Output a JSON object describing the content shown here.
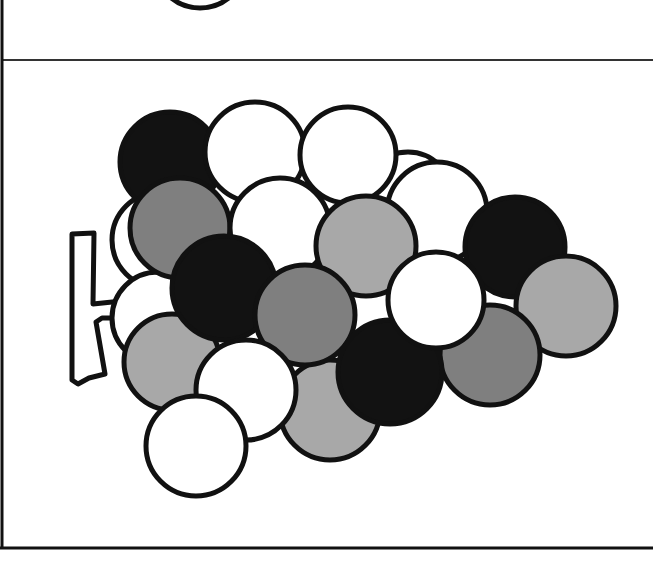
{
  "illustration": {
    "subject": "bunch of grapes",
    "colors": {
      "outline": "#111111",
      "black": "#121212",
      "dark_gray": "#7f7f7f",
      "light_gray": "#a8a8a8",
      "white": "#ffffff"
    },
    "frame": {
      "left_border_x": 2,
      "divider_y": 60,
      "bottom_border_y": 548
    },
    "top_partial_circle": {
      "cx": 200,
      "cy": -38,
      "r": 46,
      "fill": "white"
    },
    "grapes": [
      {
        "cx": 408,
        "cy": 196,
        "r": 44,
        "fill": "white"
      },
      {
        "cx": 160,
        "cy": 240,
        "r": 48,
        "fill": "white"
      },
      {
        "cx": 158,
        "cy": 318,
        "r": 46,
        "fill": "white"
      },
      {
        "cx": 170,
        "cy": 162,
        "r": 50,
        "fill": "black"
      },
      {
        "cx": 255,
        "cy": 152,
        "r": 50,
        "fill": "white"
      },
      {
        "cx": 348,
        "cy": 155,
        "r": 48,
        "fill": "white"
      },
      {
        "cx": 180,
        "cy": 228,
        "r": 50,
        "fill": "dark_gray"
      },
      {
        "cx": 437,
        "cy": 212,
        "r": 50,
        "fill": "white"
      },
      {
        "cx": 280,
        "cy": 228,
        "r": 50,
        "fill": "white"
      },
      {
        "cx": 515,
        "cy": 247,
        "r": 50,
        "fill": "black"
      },
      {
        "cx": 172,
        "cy": 362,
        "r": 48,
        "fill": "light_gray"
      },
      {
        "cx": 224,
        "cy": 288,
        "r": 52,
        "fill": "black"
      },
      {
        "cx": 330,
        "cy": 410,
        "r": 50,
        "fill": "light_gray"
      },
      {
        "cx": 366,
        "cy": 246,
        "r": 50,
        "fill": "light_gray"
      },
      {
        "cx": 305,
        "cy": 315,
        "r": 50,
        "fill": "dark_gray"
      },
      {
        "cx": 566,
        "cy": 306,
        "r": 50,
        "fill": "light_gray"
      },
      {
        "cx": 490,
        "cy": 355,
        "r": 50,
        "fill": "dark_gray"
      },
      {
        "cx": 390,
        "cy": 372,
        "r": 52,
        "fill": "black"
      },
      {
        "cx": 436,
        "cy": 300,
        "r": 48,
        "fill": "white"
      },
      {
        "cx": 246,
        "cy": 390,
        "r": 50,
        "fill": "white"
      },
      {
        "cx": 196,
        "cy": 446,
        "r": 50,
        "fill": "white"
      }
    ],
    "stem": {
      "path": "M72,234 L94,233 L93,304 L170,296 L172,318 L102,318 L96,322 L105,374 L89,378 L78,384 L72,380 Z"
    }
  }
}
